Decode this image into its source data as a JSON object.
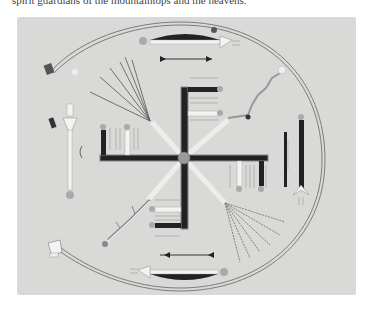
{
  "page": {
    "caption_text": "spirit guardians of the mountaintops and the heavens.",
    "caption_clipped": true
  },
  "figure": {
    "kind": "sandpainting-illustration",
    "background_color": "#d9d9d7",
    "elements": {
      "central_cross": "whirling-log cross with four arms",
      "center_disc": "gray circle at center",
      "rainbow_guardian": "double-line arc encircling the composition, open on the left",
      "figures": [
        "top horizontal figure with arrow",
        "bottom horizontal figure with arrow",
        "left vertical white figure",
        "right vertical black figure"
      ],
      "plants": [
        "upper-left branching plant",
        "upper-right branching plant",
        "lower-left branching plant",
        "lower-right branching plant"
      ]
    },
    "colors": {
      "black": "#1a1a1a",
      "white": "#f5f5f3",
      "gray_line": "#8a8a88",
      "center": "#9a9a98"
    }
  }
}
